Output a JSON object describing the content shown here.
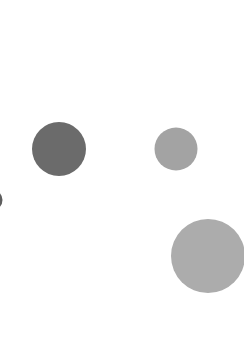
{
  "scene": {
    "background_color": "#ffffff",
    "shapes": [
      {
        "id": "dark-circle",
        "kind": "circle",
        "color": "#6b6b6b"
      },
      {
        "id": "medium-circle",
        "kind": "circle",
        "color": "#a3a3a3"
      },
      {
        "id": "large-circle",
        "kind": "circle",
        "color": "#acacac"
      },
      {
        "id": "edge-circle",
        "kind": "circle",
        "color": "#5e5e5e",
        "partially_visible": true
      }
    ]
  }
}
